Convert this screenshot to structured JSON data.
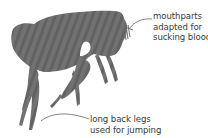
{
  "diagram": {
    "colors": {
      "body": "#6f6f6f",
      "stripe": "#5e5e5e",
      "text": "#3a3a3a",
      "leader": "#666666",
      "background": "#ffffff"
    },
    "labels": [
      {
        "id": "mouthparts",
        "lines": [
          "mouthparts",
          "adapted for",
          "sucking blood"
        ]
      },
      {
        "id": "legs",
        "lines": [
          "long back legs",
          "used for jumping"
        ]
      }
    ]
  }
}
